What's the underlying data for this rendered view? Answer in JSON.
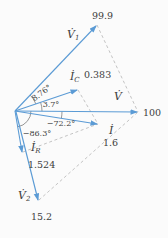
{
  "figure": {
    "type": "phasor-diagram",
    "background": "#fbfbfb",
    "colors": {
      "vector": "#5b9bd5",
      "dashed": "#b5b5b5",
      "arc": "#6a6a6a",
      "text": "#3d3d3d"
    },
    "vectors": {
      "v1": {
        "symbol": "V̇",
        "subscript": "1",
        "magnitude": "99.9",
        "angle": "8.76°"
      },
      "ic": {
        "symbol": "İ",
        "subscript": "C",
        "magnitude": "0.383",
        "angle": "3.7°"
      },
      "v": {
        "symbol": "V̇",
        "subscript": "",
        "magnitude": "100",
        "angle": ""
      },
      "i": {
        "symbol": "İ",
        "subscript": "",
        "magnitude": "1.6",
        "angle": "−72.2°"
      },
      "ir": {
        "symbol": "İ",
        "subscript": "R",
        "magnitude": "1.524",
        "angle": "−86.3°"
      },
      "v2": {
        "symbol": "V̇",
        "subscript": "2",
        "magnitude": "15.2",
        "angle": ""
      }
    }
  }
}
